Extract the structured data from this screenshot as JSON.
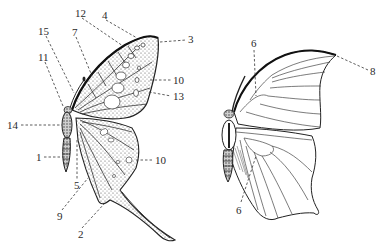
{
  "figure": {
    "type": "butterfly-wing-anatomy",
    "ink_color": "#2a2a2a",
    "background": "#ffffff"
  },
  "left_butterfly": {
    "description": "patterned swallowtail, dorsal view with numbered parts",
    "labels": [
      {
        "id": "l12",
        "text": "12",
        "x": 75,
        "y": 8
      },
      {
        "id": "l4",
        "text": "4",
        "x": 102,
        "y": 10
      },
      {
        "id": "l3",
        "text": "3",
        "x": 188,
        "y": 21
      },
      {
        "id": "l15",
        "text": "15",
        "x": 38,
        "y": 26
      },
      {
        "id": "l7",
        "text": "7",
        "x": 72,
        "y": 27
      },
      {
        "id": "l11",
        "text": "11",
        "x": 38,
        "y": 52
      },
      {
        "id": "l10a",
        "text": "10",
        "x": 173,
        "y": 76
      },
      {
        "id": "l13",
        "text": "13",
        "x": 173,
        "y": 92
      },
      {
        "id": "l14",
        "text": "14",
        "x": 7,
        "y": 121
      },
      {
        "id": "l1",
        "text": "1",
        "x": 36,
        "y": 153
      },
      {
        "id": "l10b",
        "text": "10",
        "x": 155,
        "y": 156
      },
      {
        "id": "l5",
        "text": "5",
        "x": 74,
        "y": 183
      },
      {
        "id": "l9",
        "text": "9",
        "x": 57,
        "y": 215
      },
      {
        "id": "l2",
        "text": "2",
        "x": 78,
        "y": 232
      }
    ]
  },
  "right_butterfly": {
    "description": "outline with wing venation",
    "labels": [
      {
        "id": "r6a",
        "text": "6",
        "x": 251,
        "y": 40
      },
      {
        "id": "r8",
        "text": "8",
        "x": 370,
        "y": 68
      },
      {
        "id": "r6b",
        "text": "6",
        "x": 236,
        "y": 211
      }
    ]
  }
}
